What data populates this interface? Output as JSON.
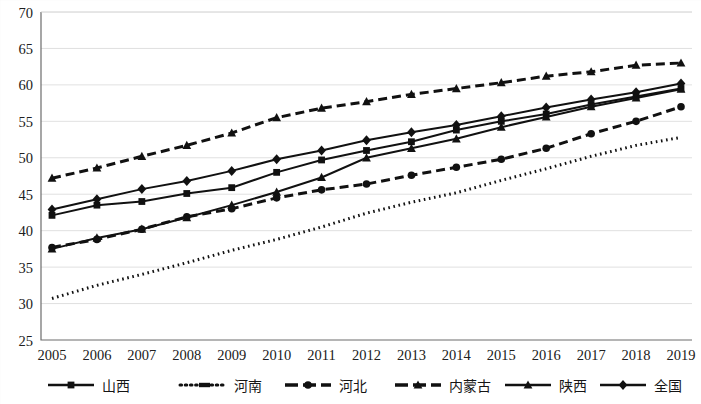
{
  "chart_data": {
    "type": "line",
    "title": "",
    "xlabel": "",
    "ylabel": "",
    "ylim": [
      25,
      70
    ],
    "ytick_step": 5,
    "yticks": [
      "25",
      "30",
      "35",
      "40",
      "45",
      "50",
      "55",
      "60",
      "65",
      "70"
    ],
    "grid": true,
    "legend_position": "bottom",
    "categories": [
      "2005",
      "2006",
      "2007",
      "2008",
      "2009",
      "2010",
      "2011",
      "2012",
      "2013",
      "2014",
      "2015",
      "2016",
      "2017",
      "2018",
      "2019"
    ],
    "series": [
      {
        "name": "山西",
        "marker": "square",
        "line_style": "solid",
        "color": "#111111",
        "values": [
          42.1,
          43.5,
          44.0,
          45.1,
          45.9,
          48.0,
          49.7,
          51.0,
          52.2,
          53.8,
          55.0,
          56.0,
          57.3,
          58.4,
          59.5
        ]
      },
      {
        "name": "河南",
        "marker": "none",
        "line_style": "dotted",
        "color": "#111111",
        "values": [
          30.7,
          32.5,
          34.0,
          35.6,
          37.3,
          38.8,
          40.5,
          42.4,
          43.9,
          45.2,
          46.9,
          48.5,
          50.2,
          51.7,
          52.8
        ]
      },
      {
        "name": "河北",
        "marker": "circle",
        "line_style": "dashed",
        "color": "#111111",
        "values": [
          37.7,
          38.8,
          40.2,
          41.9,
          43.0,
          44.5,
          45.6,
          46.4,
          47.6,
          48.7,
          49.8,
          51.3,
          53.3,
          55.0,
          57.0
        ]
      },
      {
        "name": "内蒙古",
        "marker": "triangle",
        "line_style": "dashed",
        "color": "#111111",
        "values": [
          47.2,
          48.6,
          50.2,
          51.7,
          53.4,
          55.5,
          56.8,
          57.7,
          58.7,
          59.5,
          60.3,
          61.2,
          61.8,
          62.7,
          63.0
        ]
      },
      {
        "name": "陕西",
        "marker": "triangle",
        "line_style": "solid",
        "color": "#111111",
        "values": [
          37.5,
          39.0,
          40.2,
          41.8,
          43.5,
          45.3,
          47.3,
          50.0,
          51.3,
          52.6,
          54.2,
          55.6,
          57.0,
          58.2,
          59.4
        ]
      },
      {
        "name": "全国",
        "marker": "diamond",
        "line_style": "solid",
        "color": "#111111",
        "values": [
          42.9,
          44.3,
          45.7,
          46.8,
          48.2,
          49.8,
          51.0,
          52.4,
          53.5,
          54.5,
          55.7,
          56.9,
          58.0,
          59.0,
          60.2
        ]
      }
    ]
  },
  "legend": {
    "items": [
      {
        "label": "山西",
        "marker": "square",
        "style": "solid"
      },
      {
        "label": "河南",
        "marker": "none",
        "style": "dotted"
      },
      {
        "label": "河北",
        "marker": "circle",
        "style": "dashed"
      },
      {
        "label": "内蒙古",
        "marker": "triangle",
        "style": "dashed"
      },
      {
        "label": "陕西",
        "marker": "triangle",
        "style": "solid"
      },
      {
        "label": "全国",
        "marker": "diamond",
        "style": "solid"
      }
    ]
  }
}
